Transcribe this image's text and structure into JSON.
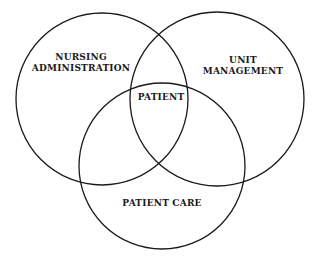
{
  "diagram": {
    "type": "venn",
    "stroke_color": "#1a1a1a",
    "background": "#ffffff",
    "circles": [
      {
        "id": "nursing-administration",
        "label_lines": [
          "NURSING",
          "ADMINISTRATION"
        ],
        "cx": 102,
        "cy": 99,
        "r": 86
      },
      {
        "id": "unit-management",
        "label_lines": [
          "UNIT",
          "MANAGEMENT"
        ],
        "cx": 217,
        "cy": 99,
        "r": 87
      },
      {
        "id": "patient-care",
        "label_lines": [
          "PATIENT CARE"
        ],
        "cx": 162,
        "cy": 166,
        "r": 83
      }
    ],
    "center_label": "PATIENT"
  }
}
